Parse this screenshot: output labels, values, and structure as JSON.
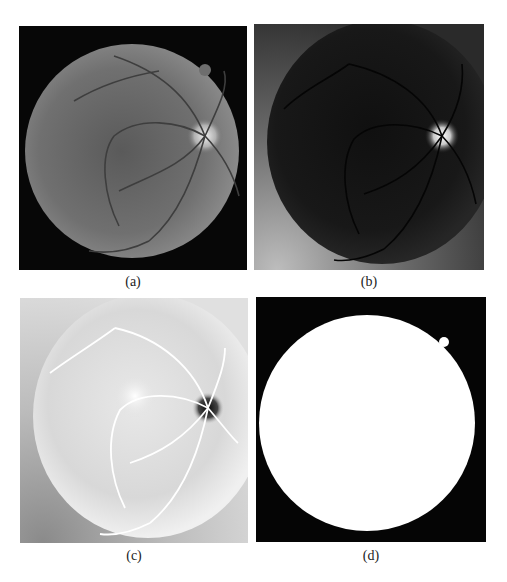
{
  "figure": {
    "panels": [
      {
        "id": "a",
        "caption": "(a)",
        "description": "Original grayscale fundus image"
      },
      {
        "id": "b",
        "caption": "(b)",
        "description": "Enhanced green-channel fundus image"
      },
      {
        "id": "c",
        "caption": "(c)",
        "description": "Inverted image with bright vessels"
      },
      {
        "id": "d",
        "caption": "(d)",
        "description": "Binary field-of-view mask"
      }
    ]
  },
  "colors": {
    "background": "#ffffff",
    "mask_black": "#050505",
    "mask_white": "#ffffff",
    "fundus_gray": "#6e6e6e",
    "inverted_bg": "#d8d8d8"
  }
}
